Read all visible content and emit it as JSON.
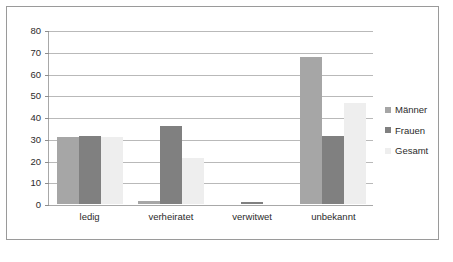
{
  "chart_data": {
    "type": "bar",
    "title": "",
    "subtitle": "",
    "xlabel": "",
    "ylabel": "",
    "categories": [
      "ledig",
      "verheiratet",
      "verwitwet",
      "unbekannt"
    ],
    "series": [
      {
        "name": "Männer",
        "color": "#a6a6a6",
        "values": [
          31,
          1.5,
          0,
          67.5
        ]
      },
      {
        "name": "Frauen",
        "color": "#808080",
        "values": [
          31.5,
          36,
          1,
          31.5
        ]
      },
      {
        "name": "Gesamt",
        "color": "#eeeeee",
        "values": [
          31,
          21,
          0,
          46.5
        ]
      }
    ],
    "ylim": [
      0,
      80
    ],
    "ytick_step": 10,
    "yticks": [
      0,
      10,
      20,
      30,
      40,
      50,
      60,
      70,
      80
    ],
    "ytick_labels": [
      "0",
      "10",
      "20",
      "30",
      "40",
      "50",
      "60",
      "70",
      "80"
    ],
    "grid": true,
    "grid_axis": "y",
    "legend_position": "right",
    "border_color": "#9a9a9a",
    "gridline_color": "#b9b9b9",
    "axis_color": "#a8a8a8",
    "background": "#ffffff"
  }
}
